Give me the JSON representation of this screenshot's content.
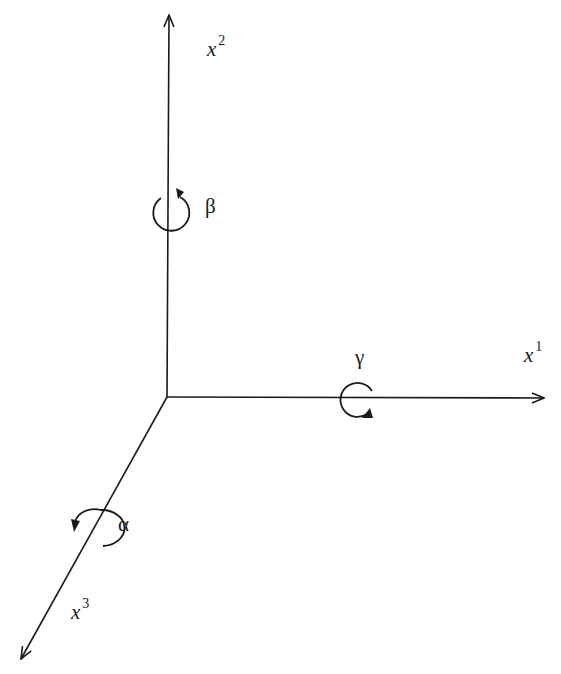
{
  "diagram": {
    "type": "coordinate-axes-rotation",
    "origin": {
      "x": 167,
      "y": 397
    },
    "stroke_color": "#1a1a1a",
    "background_color": "#ffffff",
    "axes": [
      {
        "id": "x1",
        "base": "x",
        "index": "1",
        "direction": "right",
        "end": {
          "x": 545,
          "y": 398
        },
        "rotation_label": "γ"
      },
      {
        "id": "x2",
        "base": "x",
        "index": "2",
        "direction": "up",
        "end": {
          "x": 169,
          "y": 14
        },
        "rotation_label": "β"
      },
      {
        "id": "x3",
        "base": "x",
        "index": "3",
        "direction": "down-left",
        "end": {
          "x": 20,
          "y": 660
        },
        "rotation_label": "α"
      }
    ],
    "labels": {
      "x1_base": "x",
      "x1_index": "1",
      "x2_base": "x",
      "x2_index": "2",
      "x3_base": "x",
      "x3_index": "3",
      "alpha": "α",
      "beta": "β",
      "gamma": "γ"
    }
  }
}
